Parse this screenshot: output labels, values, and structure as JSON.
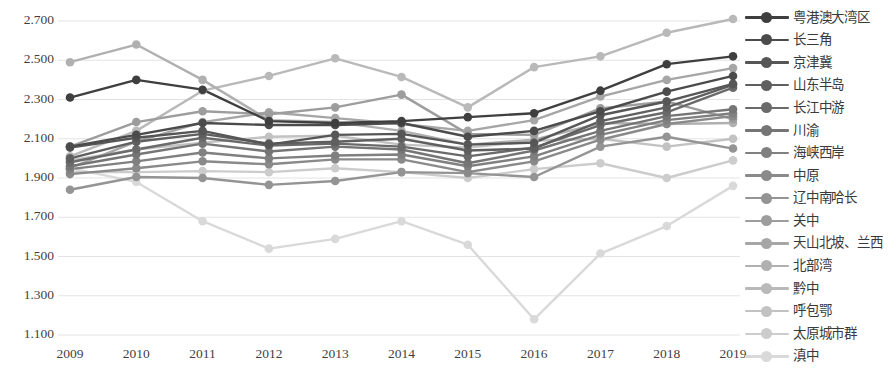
{
  "chart_data": {
    "type": "line",
    "title": "",
    "xlabel": "",
    "ylabel": "",
    "grid": true,
    "legend_position": "right",
    "ylim": [
      1.1,
      2.7
    ],
    "ytick_labels": [
      "2.700",
      "2.500",
      "2.300",
      "2.100",
      "1.900",
      "1.700",
      "1.500",
      "1.300",
      "1.100"
    ],
    "ytick_values": [
      2.7,
      2.5,
      2.3,
      2.1,
      1.9,
      1.7,
      1.5,
      1.3,
      1.1
    ],
    "categories": [
      "2009",
      "2010",
      "2011",
      "2012",
      "2013",
      "2014",
      "2015",
      "2016",
      "2017",
      "2018",
      "2019"
    ],
    "x": [
      2009,
      2010,
      2011,
      2012,
      2013,
      2014,
      2015,
      2016,
      2017,
      2018,
      2019
    ],
    "series": [
      {
        "name": "粤港澳大湾区",
        "color": "#3f3f3f",
        "values": [
          2.31,
          2.4,
          2.35,
          2.19,
          2.18,
          2.19,
          2.21,
          2.23,
          2.345,
          2.48,
          2.52
        ]
      },
      {
        "name": "长三角",
        "color": "#4b4b4b",
        "values": [
          2.06,
          2.12,
          2.18,
          2.17,
          2.17,
          2.18,
          2.11,
          2.14,
          2.24,
          2.34,
          2.42
        ]
      },
      {
        "name": "京津冀",
        "color": "#565656",
        "values": [
          2.055,
          2.105,
          2.14,
          2.07,
          2.12,
          2.125,
          2.07,
          2.08,
          2.22,
          2.29,
          2.38
        ]
      },
      {
        "name": "山东半岛",
        "color": "#5f5f5f",
        "values": [
          2.0,
          2.085,
          2.125,
          2.075,
          2.085,
          2.1,
          2.04,
          2.05,
          2.19,
          2.26,
          2.375
        ]
      },
      {
        "name": "长江中游",
        "color": "#6a6a6a",
        "values": [
          1.98,
          2.045,
          2.105,
          2.065,
          2.075,
          2.06,
          2.01,
          2.055,
          2.17,
          2.235,
          2.36
        ]
      },
      {
        "name": "川渝",
        "color": "#757575",
        "values": [
          1.96,
          2.02,
          2.075,
          2.035,
          2.06,
          2.045,
          1.975,
          2.04,
          2.14,
          2.215,
          2.25
        ]
      },
      {
        "name": "海峡西岸",
        "color": "#808080",
        "values": [
          1.945,
          1.985,
          2.03,
          2.0,
          2.015,
          2.02,
          1.96,
          2.01,
          2.12,
          2.195,
          2.23
        ]
      },
      {
        "name": "中原",
        "color": "#8a8a8a",
        "values": [
          1.92,
          1.95,
          1.985,
          1.97,
          1.995,
          1.995,
          1.93,
          1.985,
          2.095,
          2.175,
          2.215
        ]
      },
      {
        "name": "辽中南哈长",
        "color": "#949494",
        "values": [
          1.84,
          1.905,
          1.9,
          1.865,
          1.885,
          1.93,
          1.925,
          1.905,
          2.06,
          2.11,
          2.05
        ]
      },
      {
        "name": "关中",
        "color": "#9d9d9d",
        "values": [
          2.06,
          2.185,
          2.24,
          2.225,
          2.26,
          2.325,
          2.125,
          2.12,
          2.255,
          2.29,
          2.2
        ]
      },
      {
        "name": "天山北坡、兰西",
        "color": "#a6a6a6",
        "values": [
          1.95,
          2.085,
          2.185,
          2.235,
          2.205,
          2.175,
          2.14,
          2.195,
          2.315,
          2.4,
          2.46
        ]
      },
      {
        "name": "北部湾",
        "color": "#b0b0b0",
        "values": [
          2.49,
          2.58,
          2.4,
          2.195,
          2.185,
          2.14,
          2.07,
          2.095,
          2.18,
          2.175,
          2.18
        ]
      },
      {
        "name": "黔中",
        "color": "#b9b9b9",
        "values": [
          2.01,
          2.14,
          2.345,
          2.42,
          2.51,
          2.415,
          2.26,
          2.465,
          2.52,
          2.64,
          2.71
        ]
      },
      {
        "name": "呼包鄂",
        "color": "#c2c2c2",
        "values": [
          1.99,
          2.045,
          2.08,
          2.11,
          2.115,
          2.07,
          2.055,
          2.09,
          2.1,
          2.06,
          2.1
        ]
      },
      {
        "name": "太原城市群",
        "color": "#cccccc",
        "values": [
          1.93,
          1.93,
          1.935,
          1.93,
          1.95,
          1.93,
          1.9,
          1.945,
          1.975,
          1.9,
          1.99
        ]
      },
      {
        "name": "滇中",
        "color": "#d9d9d9",
        "values": [
          1.95,
          1.88,
          1.68,
          1.54,
          1.59,
          1.68,
          1.56,
          1.18,
          1.515,
          1.655,
          1.86
        ]
      }
    ]
  },
  "legend": {
    "items": [
      {
        "label": "粤港澳大湾区"
      },
      {
        "label": "长三角"
      },
      {
        "label": "京津冀"
      },
      {
        "label": "山东半岛"
      },
      {
        "label": "长江中游"
      },
      {
        "label": "川渝"
      },
      {
        "label": "海峡西岸"
      },
      {
        "label": "中原"
      },
      {
        "label": "辽中南哈长"
      },
      {
        "label": "关中"
      },
      {
        "label": "天山北坡、兰西"
      },
      {
        "label": "北部湾"
      },
      {
        "label": "黔中"
      },
      {
        "label": "呼包鄂"
      },
      {
        "label": "太原城市群"
      },
      {
        "label": "滇中"
      }
    ]
  },
  "colors": {
    "background": "#ffffff",
    "gridline": "#e3e3e3",
    "axis_text": "#3f3f3f",
    "legend_text": "#3a3a3a"
  }
}
